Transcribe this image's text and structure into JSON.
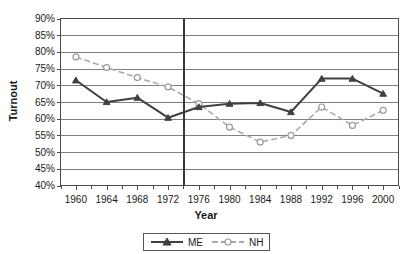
{
  "chart_data": {
    "type": "line",
    "title": "",
    "xlabel": "Year",
    "ylabel": "Turnout",
    "x": [
      1960,
      1964,
      1968,
      1972,
      1976,
      1980,
      1984,
      1988,
      1992,
      1996,
      2000
    ],
    "xlim": [
      1958,
      2002
    ],
    "ylim": [
      40,
      90
    ],
    "y_tick_labels": [
      "90%",
      "85%",
      "80%",
      "75%",
      "70%",
      "65%",
      "60%",
      "55%",
      "50%",
      "45%",
      "40%"
    ],
    "y_ticks": [
      90,
      85,
      80,
      75,
      70,
      65,
      60,
      55,
      50,
      45,
      40
    ],
    "x_tick_labels": [
      "1960",
      "1964",
      "1968",
      "1972",
      "1976",
      "1980",
      "1984",
      "1988",
      "1992",
      "1996",
      "2000"
    ],
    "x_minor_tick_interval": 2,
    "grid": "horizontal",
    "legend_position": "bottom-center",
    "annotations": [
      {
        "name": "reference-line",
        "type": "vertical-line",
        "x": 1974
      }
    ],
    "series": [
      {
        "name": "ME",
        "color": "#404040",
        "marker": "triangle",
        "linestyle": "solid",
        "values": [
          71.5,
          65.0,
          66.3,
          60.3,
          63.5,
          64.5,
          64.7,
          62.0,
          72.0,
          72.0,
          67.5
        ]
      },
      {
        "name": "NH",
        "color": "#aaaaaa",
        "marker": "open-circle",
        "linestyle": "dashed",
        "values": [
          78.5,
          75.3,
          72.3,
          69.5,
          64.5,
          57.5,
          53.0,
          55.0,
          63.5,
          58.0,
          62.5
        ]
      }
    ]
  },
  "legend": {
    "entries": [
      {
        "label": "ME"
      },
      {
        "label": "NH"
      }
    ]
  }
}
